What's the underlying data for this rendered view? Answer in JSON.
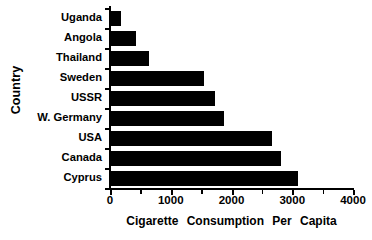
{
  "chart_data": {
    "type": "bar",
    "orientation": "horizontal",
    "title": "",
    "xlabel": "Cigarette  Consumption  Per  Capita",
    "ylabel": "Country",
    "categories": [
      "Uganda",
      "Angola",
      "Thailand",
      "Sweden",
      "USSR",
      "W. Germany",
      "USA",
      "Canada",
      "Cyprus"
    ],
    "values": [
      180,
      430,
      640,
      1550,
      1730,
      1880,
      2670,
      2820,
      3090
    ],
    "xlim": [
      0,
      4000
    ],
    "xticks": [
      0,
      1000,
      2000,
      3000,
      4000
    ],
    "xtick_labels": [
      "0",
      "1000",
      "2000",
      "3000",
      "4000"
    ],
    "minor_xticks": [
      500,
      1500,
      2500,
      3500
    ],
    "grid": false,
    "legend": false,
    "bar_color": "#000000",
    "background_color": "#ffffff"
  },
  "axes": {
    "y_title": "Country",
    "x_title": "Cigarette  Consumption  Per  Capita"
  }
}
